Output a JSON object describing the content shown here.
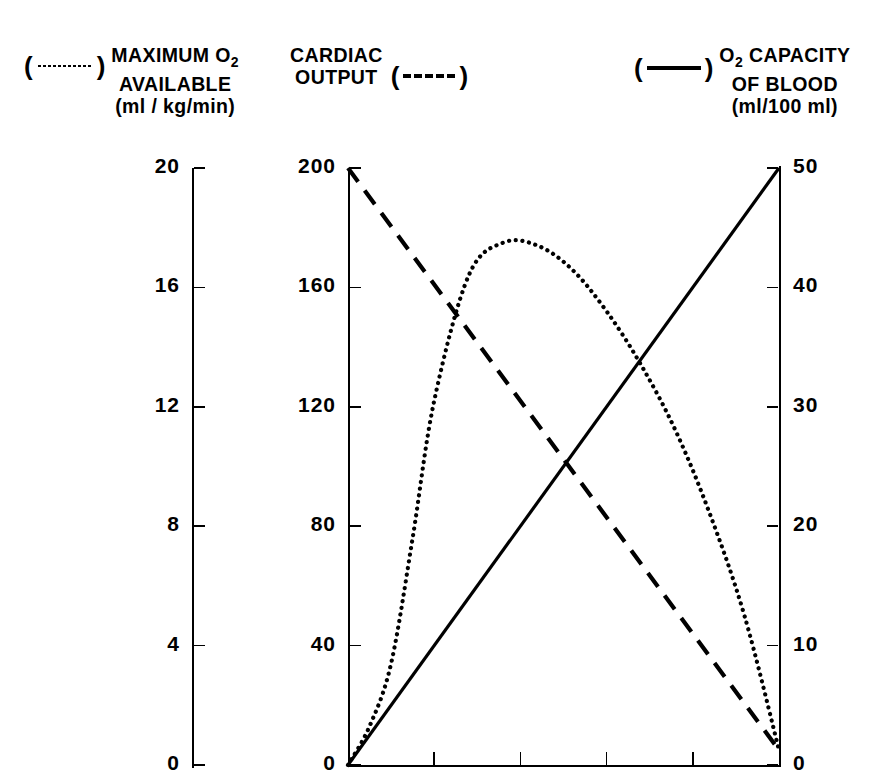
{
  "legend": [
    {
      "symbol": "dotted",
      "symbol_name": "dotted-line-symbol",
      "line1": "MAXIMUM O",
      "sub1": "2",
      "line2": "AVAILABLE",
      "line3": "(ml / kg/min)"
    },
    {
      "symbol": "dashed",
      "symbol_name": "dashed-line-symbol",
      "line1": "CARDIAC",
      "sub1": "",
      "line2": "OUTPUT",
      "line3": ""
    },
    {
      "symbol": "solid",
      "symbol_name": "solid-line-symbol",
      "line1": "O",
      "sub1": "2",
      "line1b": " CAPACITY",
      "line2": "OF BLOOD",
      "line3": "(ml/100 ml)"
    }
  ],
  "chart_data": {
    "type": "line",
    "title": "",
    "xlabel": "",
    "grid": false,
    "legend_position": "top",
    "x": [
      0,
      0.2,
      0.4,
      0.6,
      0.8,
      1.0
    ],
    "xlim": [
      0,
      1
    ],
    "x_tick_count": 6,
    "x_tick_labels": [
      "",
      "",
      "",
      "",
      "",
      ""
    ],
    "axes": [
      {
        "id": "max-o2-available",
        "name": "MAXIMUM O2 AVAILABLE",
        "units": "ml / kg/min",
        "ticks": [
          0,
          4,
          8,
          12,
          16,
          20
        ],
        "range": [
          0,
          20
        ],
        "side": "left",
        "series_style": "dotted"
      },
      {
        "id": "cardiac-output",
        "name": "CARDIAC OUTPUT",
        "units": "ml / kg/min",
        "ticks": [
          0,
          40,
          80,
          120,
          160,
          200
        ],
        "range": [
          0,
          200
        ],
        "side": "left",
        "series_style": "dashed"
      },
      {
        "id": "o2-capacity-of-blood",
        "name": "O2 CAPACITY OF BLOOD",
        "units": "ml/100 ml",
        "ticks": [
          0,
          10,
          20,
          30,
          40,
          50
        ],
        "range": [
          0,
          50
        ],
        "side": "right",
        "series_style": "solid"
      }
    ],
    "series": [
      {
        "name": "MAXIMUM O2 AVAILABLE",
        "style": "dotted",
        "axis": "max-o2-available",
        "x": [
          0.0,
          0.05,
          0.1,
          0.15,
          0.2,
          0.28,
          0.36,
          0.44,
          0.52,
          0.6,
          0.68,
          0.76,
          0.84,
          0.92,
          1.0
        ],
        "values": [
          0.0,
          1.3,
          3.4,
          7.6,
          12.2,
          16.4,
          17.5,
          17.4,
          16.6,
          15.2,
          13.4,
          11.2,
          8.4,
          5.0,
          0.5
        ]
      },
      {
        "name": "CARDIAC OUTPUT",
        "style": "dashed",
        "axis": "cardiac-output",
        "x": [
          0.0,
          1.0
        ],
        "values": [
          200.0,
          5.0
        ]
      },
      {
        "name": "O2 CAPACITY OF BLOOD",
        "style": "solid",
        "axis": "o2-capacity-of-blood",
        "x": [
          0.0,
          1.0
        ],
        "values": [
          0.0,
          50.0
        ]
      }
    ],
    "colors": {
      "ink": "#000000",
      "background": "#ffffff"
    }
  }
}
